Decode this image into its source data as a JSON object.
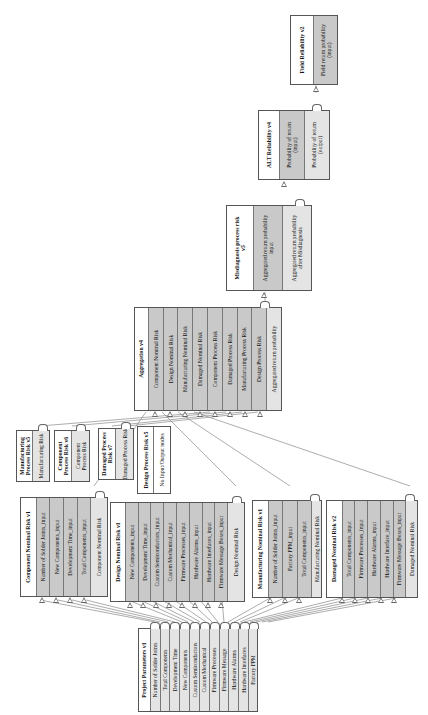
{
  "diagram": {
    "orientation": "rotated -90deg (reads bottom-to-top)",
    "nodes": {
      "project_parameters": {
        "title": "Project Parameters v1",
        "outputs": [
          "Number of Solder Joints",
          "Total Components",
          "Development Time",
          "New Components",
          "Custom Semiconductors",
          "Custom Mechanical",
          "Firmware Processes",
          "Firmware Message",
          "Hardware Alarms",
          "Hardware Interfaces",
          "Factory FPM"
        ]
      },
      "component_nominal_risk": {
        "title": "Component Nominal Risk v1",
        "inputs": [
          "Number of Solder Joints_input",
          "New Components_input",
          "Development Time_input",
          "Total Components_input"
        ],
        "outputs": [
          "Component Nominal Risk"
        ]
      },
      "design_nominal_risk": {
        "title": "Design Nominal Risk v1",
        "inputs": [
          "New Components_input",
          "Development Time_input",
          "Custom Semiconductors_input",
          "Custom Mechanical_input",
          "Firmware Processes_input",
          "Hardware Alarms_input",
          "Hardware Interfaces_input",
          "Firmware Message Boxes_input"
        ],
        "outputs": [
          "Design Nominal Risk"
        ]
      },
      "manufacturing_nominal_risk": {
        "title": "Manufacturing Nominal Risk v1",
        "inputs": [
          "Number of Solder Joints_input",
          "Factory FPM_input",
          "Total Components_input"
        ],
        "outputs": [
          "Manufacturing Nominal Risk"
        ]
      },
      "damaged_nominal_risk": {
        "title": "Damaged Nominal Risk v2",
        "inputs": [
          "Total Components_input",
          "Firmware Processes_input",
          "Hardware Alarms_input",
          "Hardware Interface_input",
          "Firmware Message Boxes_input"
        ],
        "outputs": [
          "Damaged Nominal Risk"
        ]
      },
      "manufacturing_process_risk": {
        "title": "Manufacturing Process Risk v5",
        "outputs": [
          "Manufacturing Risk"
        ]
      },
      "component_process_risk": {
        "title": "Component Process Risk v6",
        "outputs": [
          "Component Process Risk"
        ]
      },
      "damaged_process_risk": {
        "title": "Damaged Process Risk v7",
        "outputs": [
          "Damaged Process Risk"
        ]
      },
      "design_process_risk": {
        "title": "Design Process Risk v5",
        "note": "No Input/Output nodes"
      },
      "aggregation": {
        "title": "Aggregation v4",
        "inputs": [
          "Component Nominal Risk",
          "Design Nominal Risk",
          "Manufacturing Nominal Risk",
          "Damaged Nominal Risk",
          "Component Process Risk",
          "Damaged Process Risk",
          "Manufacturing Process Risk",
          "Design Process Risk"
        ],
        "outputs": [
          "Aggregated return probability"
        ]
      },
      "misdiagnosis": {
        "title": "Misdiagnosis process risk v5",
        "inputs": [
          "Aggregated return probability input"
        ],
        "outputs": [
          "Aggregated return probability after Misdiagnosis"
        ]
      },
      "alt_reliability": {
        "title": "ALT Reliability v4",
        "inputs": [
          "Probability of return (input)"
        ],
        "outputs": [
          "Probability of return (output)"
        ]
      },
      "field_reliability": {
        "title": "Field Reliability v2",
        "inputs": [
          "Field return probability (input)"
        ]
      }
    }
  },
  "colors": {
    "input_cell": "#c9c9c9",
    "output_cell": "#e4e4e4",
    "title_cell": "#ffffff",
    "border": "#555555",
    "wire": "#777777"
  }
}
